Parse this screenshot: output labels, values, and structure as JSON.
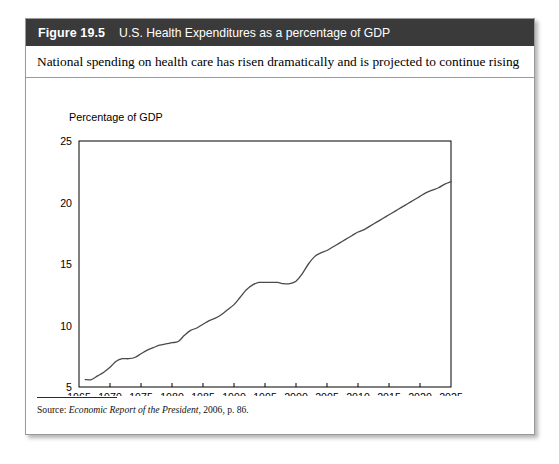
{
  "figure": {
    "number": "Figure 19.5",
    "title": "U.S. Health Expenditures as a percentage of GDP",
    "subtitle": "National spending on health care has risen dramatically and is projected to continue rising",
    "source_label": "Source:",
    "source_italic": "Economic Report of the President",
    "source_rest": ", 2006, p. 86."
  },
  "colors": {
    "header_bg": "#3a3a3a",
    "header_text": "#ffffff",
    "border": "#9a9a9a",
    "axis": "#000000",
    "line": "#4a4a4a",
    "page_bg": "#ffffff"
  },
  "chart_data": {
    "type": "line",
    "title": "U.S. Health Expenditures as a percentage of GDP",
    "xlabel": "",
    "ylabel": "Percentage of GDP",
    "ylabel_position": "above-axis",
    "xlim": [
      1965,
      2025
    ],
    "ylim": [
      5,
      25
    ],
    "xticks": [
      1965,
      1970,
      1975,
      1980,
      1985,
      1990,
      1995,
      2000,
      2005,
      2010,
      2015,
      2020,
      2025
    ],
    "yticks": [
      5,
      10,
      15,
      20,
      25
    ],
    "xtick_labels": [
      "1965",
      "1970",
      "1975",
      "1980",
      "1985",
      "1990",
      "1995",
      "2000",
      "2005",
      "2010",
      "2015",
      "2020",
      "2025"
    ],
    "ytick_labels": [
      "5",
      "10",
      "15",
      "20",
      "25"
    ],
    "grid": false,
    "legend": null,
    "series": [
      {
        "name": "Health expenditures as % of GDP",
        "x": [
          1966,
          1967,
          1968,
          1969,
          1970,
          1971,
          1972,
          1973,
          1974,
          1975,
          1976,
          1977,
          1978,
          1979,
          1980,
          1981,
          1982,
          1983,
          1984,
          1985,
          1986,
          1987,
          1988,
          1989,
          1990,
          1991,
          1992,
          1993,
          1994,
          1995,
          1996,
          1997,
          1998,
          1999,
          2000,
          2001,
          2002,
          2003,
          2004,
          2005,
          2006,
          2007,
          2008,
          2009,
          2010,
          2011,
          2012,
          2013,
          2014,
          2015,
          2016,
          2017,
          2018,
          2019,
          2020,
          2021,
          2022,
          2023,
          2024,
          2025
        ],
        "values": [
          5.6,
          5.6,
          5.9,
          6.2,
          6.6,
          7.1,
          7.3,
          7.3,
          7.4,
          7.7,
          8.0,
          8.2,
          8.4,
          8.5,
          8.6,
          8.7,
          9.2,
          9.6,
          9.8,
          10.1,
          10.4,
          10.6,
          10.9,
          11.3,
          11.7,
          12.3,
          12.9,
          13.3,
          13.5,
          13.5,
          13.5,
          13.5,
          13.4,
          13.4,
          13.6,
          14.2,
          15.0,
          15.6,
          15.9,
          16.1,
          16.4,
          16.7,
          17.0,
          17.3,
          17.6,
          17.8,
          18.1,
          18.4,
          18.7,
          19.0,
          19.3,
          19.6,
          19.9,
          20.2,
          20.5,
          20.8,
          21.0,
          21.2,
          21.5,
          21.7
        ]
      }
    ]
  }
}
